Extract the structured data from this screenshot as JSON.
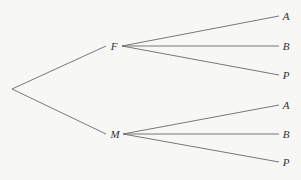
{
  "diagram": {
    "type": "probability-tree",
    "line_color": "#6a6a6a",
    "label_color": "#333333",
    "root": {
      "x": 12,
      "y": 89
    },
    "level1": [
      {
        "id": "F",
        "label": "F",
        "label_pos": {
          "x": 114,
          "y": 46
        },
        "edge_in_end": {
          "x": 106,
          "y": 46
        },
        "edge_out_start": {
          "x": 122,
          "y": 46
        },
        "children": [
          {
            "id": "F-A",
            "label": "A",
            "label_pos": {
              "x": 286,
              "y": 16
            },
            "edge_end": {
              "x": 279,
              "y": 16
            }
          },
          {
            "id": "F-B",
            "label": "B",
            "label_pos": {
              "x": 286,
              "y": 46
            },
            "edge_end": {
              "x": 279,
              "y": 46
            }
          },
          {
            "id": "F-P",
            "label": "P",
            "label_pos": {
              "x": 286,
              "y": 75
            },
            "edge_end": {
              "x": 279,
              "y": 75
            }
          }
        ]
      },
      {
        "id": "M",
        "label": "M",
        "label_pos": {
          "x": 115,
          "y": 134
        },
        "edge_in_end": {
          "x": 106,
          "y": 134
        },
        "edge_out_start": {
          "x": 123,
          "y": 134
        },
        "children": [
          {
            "id": "M-A",
            "label": "A",
            "label_pos": {
              "x": 286,
              "y": 105
            },
            "edge_end": {
              "x": 279,
              "y": 105
            }
          },
          {
            "id": "M-B",
            "label": "B",
            "label_pos": {
              "x": 286,
              "y": 134
            },
            "edge_end": {
              "x": 279,
              "y": 134
            }
          },
          {
            "id": "M-P",
            "label": "P",
            "label_pos": {
              "x": 286,
              "y": 162
            },
            "edge_end": {
              "x": 279,
              "y": 162
            }
          }
        ]
      }
    ]
  }
}
